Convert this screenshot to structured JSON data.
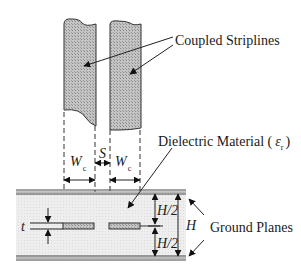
{
  "diagram": {
    "labels": {
      "striplines": "Coupled Striplines",
      "dielectric": "Dielectric Material (",
      "dielectric_symbol": "ε",
      "dielectric_sub": "r",
      "dielectric_close": ")",
      "ground_planes": "Ground Planes"
    },
    "dimensions": {
      "width_symbol": "W",
      "width_sub": "c",
      "spacing": "S",
      "thickness": "t",
      "half_height_top": "H/2",
      "half_height_bottom": "H/2",
      "height": "H"
    },
    "colors": {
      "hatch_fill": "#b8b8b8",
      "dielectric_fill": "#ececec",
      "line": "#222222",
      "ground_plane": "#555555"
    }
  }
}
